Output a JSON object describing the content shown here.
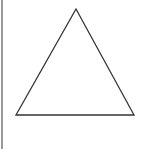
{
  "diagram": {
    "shape": "triangle",
    "type": "equilateral",
    "fill": "#ffffff",
    "stroke": "#333333",
    "vertices": [
      [
        76,
        9
      ],
      [
        16,
        115
      ],
      [
        134,
        115
      ]
    ],
    "border_color": "#9a9a9a"
  }
}
